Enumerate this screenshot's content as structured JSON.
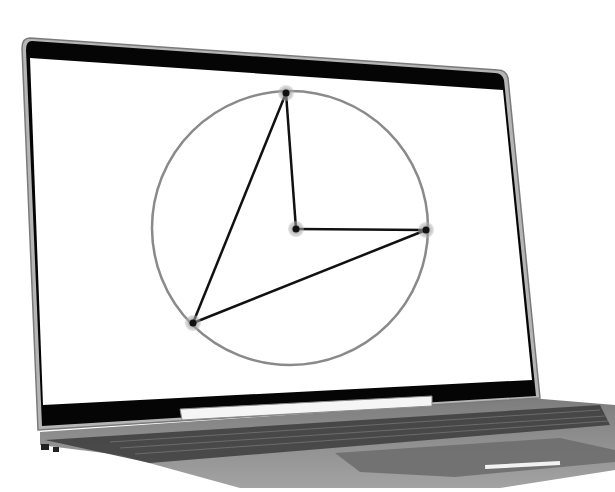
{
  "scene": {
    "subject": "laptop",
    "background_color": "#ffffff"
  },
  "laptop": {
    "frame_color": "#9a9a9a",
    "bezel_color": "#050505",
    "screen_color": "#ffffff",
    "deck_color": "#8c8c8c",
    "keyboard_color": "#3a3a3a",
    "trackpad_color": "#6e6e6e",
    "highlight_color": "#f2f2f2"
  },
  "screen_content": {
    "type": "geometry-diagram",
    "circle": {
      "cx": 290,
      "cy": 228,
      "rx": 138,
      "ry": 137,
      "stroke": "#8a8a8a"
    },
    "center_point": {
      "x": 296,
      "y": 229
    },
    "points": [
      {
        "name": "top",
        "x": 286,
        "y": 93
      },
      {
        "name": "right",
        "x": 426,
        "y": 230
      },
      {
        "name": "bottom-left",
        "x": 193,
        "y": 323
      }
    ],
    "segments": [
      {
        "from": "center",
        "to": "top"
      },
      {
        "from": "center",
        "to": "right"
      },
      {
        "from": "top",
        "to": "bottom-left"
      },
      {
        "from": "bottom-left",
        "to": "right"
      }
    ],
    "line_color": "#111111",
    "point_halo_color": "#a8a8a8"
  }
}
